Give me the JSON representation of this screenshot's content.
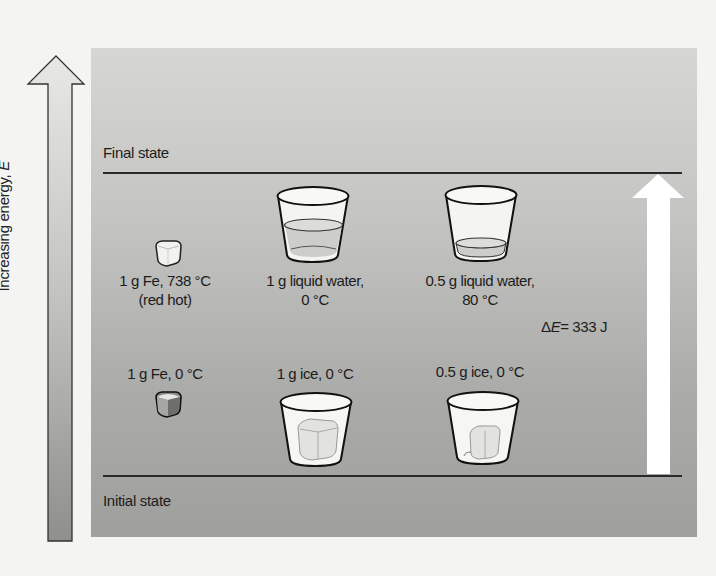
{
  "figure": {
    "axis": {
      "label": "Increasing energy, ",
      "label_symbol": "E",
      "gradient_top": "#e6e6e4",
      "gradient_bottom": "#8e8e8c"
    },
    "final_state": {
      "label": "Final state"
    },
    "initial_state": {
      "label": "Initial state"
    },
    "energy_change": {
      "delta": "Δ",
      "symbol": "E",
      "value": "= 333 J"
    },
    "final_items": [
      {
        "id": "fe-hot",
        "line1": "1 g Fe, 738 °C",
        "line2": "(red hot)",
        "icon": "iron-cube-icon"
      },
      {
        "id": "water-1g",
        "line1": "1 g liquid water,",
        "line2": "0 °C",
        "icon": "glass-full-water-icon"
      },
      {
        "id": "water-half",
        "line1": "0.5 g liquid water,",
        "line2": "80 °C",
        "icon": "glass-low-water-icon"
      }
    ],
    "initial_items": [
      {
        "id": "fe-cold",
        "line1": "1 g Fe, 0 °C",
        "icon": "iron-cube-icon"
      },
      {
        "id": "ice-1g",
        "line1": "1 g ice, 0 °C",
        "icon": "glass-ice-icon"
      },
      {
        "id": "ice-half",
        "line1": "0.5 g ice, 0 °C",
        "icon": "glass-small-ice-icon"
      }
    ],
    "colors": {
      "panel": "#c0c0be",
      "line": "#2a2a2a",
      "white_arrow": "#ffffff",
      "glass": "#f6f6f4",
      "water": "#cfcfcd"
    }
  }
}
